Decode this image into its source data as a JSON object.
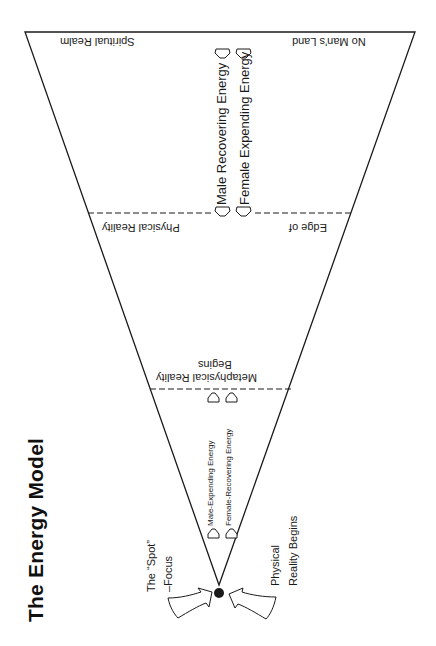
{
  "title": "The Energy Model",
  "regions": {
    "spiritual_realm": "Spiritual Realm",
    "no_mans_land": "No Man's Land",
    "physical_reality": "Physical Reality",
    "edge_of": "Edge of",
    "metaphysical_line1": "Metaphysical Reality",
    "metaphysical_line2": "Begins"
  },
  "energy_flows": {
    "male_recovering": "Male Recovering Energy",
    "female_expending": "Female Expending Energy",
    "male_expending": "Male-Expending Energy",
    "female_recovering": "Female-Recovering Energy"
  },
  "focus_labels": {
    "spot_line1": "The “Spot”",
    "spot_line2": "–Focus",
    "physical_line1": "Physical",
    "physical_line2": "Reality Begins"
  },
  "colors": {
    "line": "#1a1a1a",
    "background": "#ffffff"
  }
}
